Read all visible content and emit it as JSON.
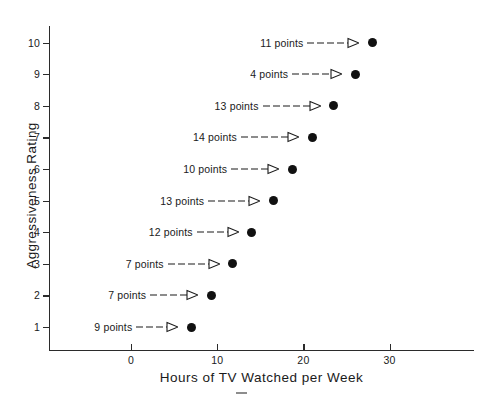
{
  "chart_data": {
    "type": "scatter",
    "title": "",
    "xlabel": "Hours of TV Watched per Week",
    "ylabel": "Aggressiveness Rating",
    "xlim": [
      -5,
      35
    ],
    "ylim": [
      0,
      11
    ],
    "xticks": [
      0,
      10,
      20,
      30
    ],
    "xtick_labels": [
      "0",
      "10",
      "20",
      "30"
    ],
    "yticks": [
      1,
      2,
      3,
      4,
      5,
      6,
      7,
      8,
      9,
      10
    ],
    "ytick_labels": [
      "1",
      "2",
      "3",
      "4",
      "5",
      "6",
      "7",
      "8",
      "9",
      "10"
    ],
    "grid": false,
    "legend": null,
    "marker": "filled-circle",
    "marker_color": "#111111",
    "x": [
      7.0,
      9.3,
      11.8,
      14.0,
      16.5,
      18.7,
      21.0,
      23.5,
      26.0,
      28.0
    ],
    "y": [
      1,
      2,
      3,
      4,
      5,
      6,
      7,
      8,
      9,
      10
    ],
    "annotations": [
      {
        "rating": 1,
        "hours": 7.0,
        "label": "9 points",
        "arrow": "dashed-to-open-triangle"
      },
      {
        "rating": 2,
        "hours": 9.3,
        "label": "7 points",
        "arrow": "dashed-to-open-triangle"
      },
      {
        "rating": 3,
        "hours": 11.8,
        "label": "7 points",
        "arrow": "dashed-to-open-triangle"
      },
      {
        "rating": 4,
        "hours": 14.0,
        "label": "12 points",
        "arrow": "dashed-to-open-triangle"
      },
      {
        "rating": 5,
        "hours": 16.5,
        "label": "13 points",
        "arrow": "dashed-to-open-triangle"
      },
      {
        "rating": 6,
        "hours": 18.7,
        "label": "10 points",
        "arrow": "dashed-to-open-triangle"
      },
      {
        "rating": 7,
        "hours": 21.0,
        "label": "14 points",
        "arrow": "dashed-to-open-triangle"
      },
      {
        "rating": 8,
        "hours": 23.5,
        "label": "13 points",
        "arrow": "dashed-to-open-triangle"
      },
      {
        "rating": 9,
        "hours": 26.0,
        "label": "4 points",
        "arrow": "dashed-to-open-triangle"
      },
      {
        "rating": 10,
        "hours": 28.0,
        "label": "11 points",
        "arrow": "dashed-to-open-triangle"
      }
    ]
  },
  "colors": {
    "axis": "#2b2b2b",
    "marker": "#111111",
    "text": "#1a1a1a",
    "background": "#ffffff"
  }
}
